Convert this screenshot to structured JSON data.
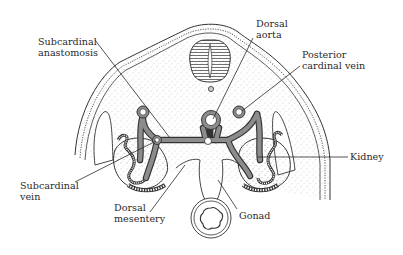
{
  "diagram": {
    "colors": {
      "background": "#ffffff",
      "ink": "#2a2a2a",
      "stipple": "#9a9a9a",
      "vessel_fill": "#8c8c8c"
    },
    "labels": {
      "subcardinal_anastomosis": [
        "Subcardinal",
        "anastomosis"
      ],
      "dorsal_aorta": [
        "Dorsal",
        "aorta"
      ],
      "posterior_cardinal_vein": [
        "Posterior",
        "cardinal vein"
      ],
      "kidney": [
        "Kidney"
      ],
      "subcardinal_vein": [
        "Subcardinal",
        "vein"
      ],
      "dorsal_mesentery": [
        "Dorsal",
        "mesentery"
      ],
      "gonad": [
        "Gonad"
      ]
    },
    "structures": [
      "neural-tube",
      "notochord",
      "dorsal-aorta",
      "posterior-cardinal-veins",
      "subcardinal-veins",
      "subcardinal-anastomosis",
      "mesonephric-kidneys",
      "gonads",
      "dorsal-mesentery",
      "gut"
    ]
  }
}
